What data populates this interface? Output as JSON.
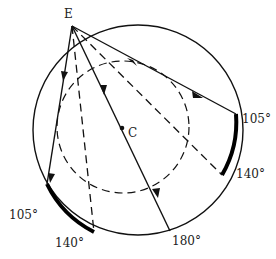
{
  "diagram": {
    "type": "geometry-ray-diagram",
    "outer_circle": {
      "cx": 138,
      "cy": 130,
      "r": 105
    },
    "inner_circle": {
      "cx": 123,
      "cy": 127,
      "r": 66,
      "style": "dashed"
    },
    "points": {
      "E": {
        "label": "E",
        "x": 72,
        "y": 26
      },
      "C": {
        "label": "C",
        "x": 122,
        "y": 128
      }
    },
    "solid_rays": [
      {
        "name": "ray-to-right-105",
        "to": [
          236,
          114
        ],
        "arrow_t": 0.62
      },
      {
        "name": "ray-through-center-180",
        "to": [
          170,
          231
        ],
        "arrow_t": 0.3
      },
      {
        "name": "ray-to-left-105",
        "to": [
          47,
          184
        ],
        "arrow_t": 0.33
      }
    ],
    "dashed_rays": [
      {
        "name": "dashed-to-right-140",
        "to": [
          222,
          175
        ]
      },
      {
        "name": "dashed-to-left-140",
        "to": [
          94,
          232
        ]
      }
    ],
    "arc_highlights": [
      {
        "name": "right-arc-105-140",
        "from": [
          236,
          114
        ],
        "to": [
          222,
          175
        ]
      },
      {
        "name": "left-arc-105-140",
        "from": [
          47,
          184
        ],
        "to": [
          94,
          232
        ]
      }
    ],
    "angle_labels": {
      "right_105": "105°",
      "right_140": "140°",
      "bottom_180": "180°",
      "left_105": "105°",
      "left_140": "140°"
    }
  }
}
